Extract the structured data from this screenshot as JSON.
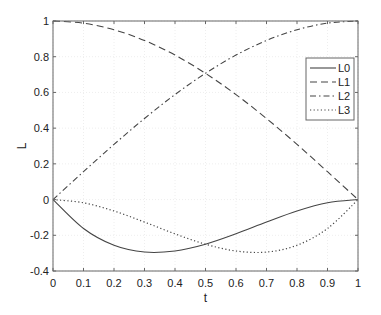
{
  "chart_data": {
    "type": "line",
    "title": "",
    "xlabel": "t",
    "ylabel": "L",
    "xlim": [
      0,
      1
    ],
    "ylim": [
      -0.4,
      1
    ],
    "grid": true,
    "legend_position": "upper right",
    "x_ticks": [
      "0",
      "0.1",
      "0.2",
      "0.3",
      "0.4",
      "0.5",
      "0.6",
      "0.7",
      "0.8",
      "0.9",
      "1"
    ],
    "y_ticks": [
      "-0.4",
      "-0.2",
      "0",
      "0.2",
      "0.4",
      "0.6",
      "0.8",
      "1"
    ],
    "x": [
      0,
      0.1,
      0.2,
      0.3,
      0.4,
      0.5,
      0.6,
      0.7,
      0.8,
      0.9,
      1.0
    ],
    "series": [
      {
        "name": "L0",
        "style": "solid",
        "values": [
          0,
          -0.162,
          -0.256,
          -0.294,
          -0.288,
          -0.25,
          -0.192,
          -0.126,
          -0.064,
          -0.018,
          0
        ]
      },
      {
        "name": "L1",
        "style": "dashed",
        "values": [
          1,
          0.988,
          0.951,
          0.891,
          0.809,
          0.707,
          0.588,
          0.454,
          0.309,
          0.156,
          0
        ]
      },
      {
        "name": "L2",
        "style": "dashdot",
        "values": [
          0,
          0.156,
          0.309,
          0.454,
          0.588,
          0.707,
          0.809,
          0.891,
          0.951,
          0.988,
          1
        ]
      },
      {
        "name": "L3",
        "style": "dotted",
        "values": [
          0,
          -0.018,
          -0.064,
          -0.126,
          -0.192,
          -0.25,
          -0.288,
          -0.294,
          -0.256,
          -0.162,
          0
        ]
      }
    ]
  },
  "legend": {
    "items": [
      {
        "label": "L0"
      },
      {
        "label": "L1"
      },
      {
        "label": "L2"
      },
      {
        "label": "L3"
      }
    ]
  },
  "colors": {
    "line": "#444444",
    "axis": "#666666",
    "grid": "#eeeeee"
  }
}
